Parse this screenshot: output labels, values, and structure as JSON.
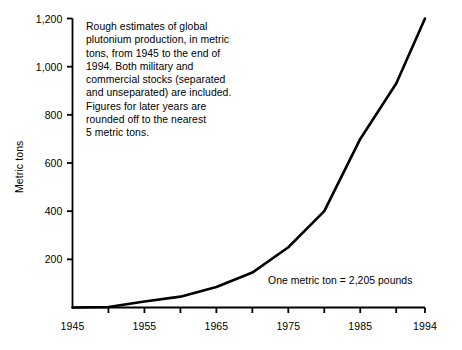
{
  "chart_data": {
    "type": "line",
    "title": "",
    "subtitle": "",
    "xlabel": "",
    "ylabel": "Metric tons",
    "xlim": [
      1945,
      1994
    ],
    "ylim": [
      0,
      1200
    ],
    "grid": false,
    "legend": "none",
    "x": [
      1945,
      1950,
      1955,
      1960,
      1965,
      1970,
      1975,
      1980,
      1985,
      1990,
      1994
    ],
    "values": [
      0,
      2,
      25,
      45,
      85,
      145,
      250,
      400,
      700,
      930,
      1200
    ],
    "series": [
      {
        "name": "Global plutonium production",
        "values": [
          0,
          2,
          25,
          45,
          85,
          145,
          250,
          400,
          700,
          930,
          1200
        ]
      }
    ],
    "y_tick_values": [
      0,
      200,
      400,
      600,
      800,
      1000,
      1200
    ],
    "y_tick_labels": [
      "",
      "200",
      "400",
      "600",
      "800",
      "1,000",
      "1,200"
    ],
    "x_tick_values": [
      1945,
      1950,
      1955,
      1960,
      1965,
      1970,
      1975,
      1980,
      1985,
      1990,
      1994
    ],
    "x_tick_labels": [
      "1945",
      "",
      "1955",
      "",
      "1965",
      "",
      "1975",
      "",
      "1985",
      "",
      "1994"
    ],
    "line_color": "#000000",
    "axis_color": "#000000",
    "background_color": "#ffffff",
    "annotations": [
      "Rough estimates of global plutonium production, in metric tons, from 1945 to the end of 1994. Both military and commercial stocks (separated and unseparated) are included. Figures for later years are rounded off to the nearest 5 metric tons.",
      "One metric ton = 2,205 pounds"
    ]
  },
  "axes": {
    "y_title": "Metric tons",
    "y_labels": [
      {
        "text": "1,200",
        "value": 1200
      },
      {
        "text": "1,000",
        "value": 1000
      },
      {
        "text": "800",
        "value": 800
      },
      {
        "text": "600",
        "value": 600
      },
      {
        "text": "400",
        "value": 400
      },
      {
        "text": "200",
        "value": 200
      }
    ],
    "x_labels": [
      {
        "text": "1945",
        "value": 1945
      },
      {
        "text": "1955",
        "value": 1955
      },
      {
        "text": "1965",
        "value": 1965
      },
      {
        "text": "1975",
        "value": 1975
      },
      {
        "text": "1985",
        "value": 1985
      },
      {
        "text": "1994",
        "value": 1994
      }
    ]
  },
  "description": {
    "lines": [
      "Rough estimates of global",
      "plutonium production, in metric",
      "tons, from 1945 to the end of",
      "1994. Both military and",
      "commercial stocks (separated",
      "and unseparated) are included.",
      "Figures for later years are",
      "rounded off to the nearest",
      "5 metric tons."
    ]
  },
  "footnote": {
    "text": "One metric ton = 2,205 pounds"
  }
}
